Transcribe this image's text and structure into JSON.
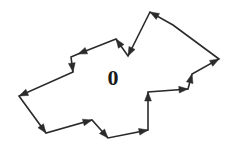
{
  "figure": {
    "name": "oriented-polygon-boundary",
    "canvas": {
      "width": 232,
      "height": 148,
      "background": "#ffffff"
    },
    "stroke": {
      "color": "#2b2b2b",
      "width": 1.6,
      "linejoin": "miter",
      "linecap": "butt"
    },
    "arrowhead": {
      "style": "solid-triangle",
      "length": 9,
      "half_width": 3.4,
      "color": "#2b2b2b"
    },
    "label": {
      "text": "0",
      "x": 113,
      "y": 78,
      "font_size": 22,
      "font_weight": "bold",
      "color": "#1a1a1a"
    },
    "orientation": "counterclockwise-chain",
    "vertex_count": 16,
    "closed": true,
    "vertices": [
      {
        "id": "v1",
        "x": 150,
        "y": 12,
        "arrow_in": true
      },
      {
        "id": "v2",
        "x": 128,
        "y": 56,
        "arrow_in": true
      },
      {
        "id": "v3",
        "x": 116,
        "y": 39,
        "arrow_in": true
      },
      {
        "id": "v4",
        "x": 78,
        "y": 54,
        "arrow_in": true
      },
      {
        "id": "v5",
        "x": 71,
        "y": 57,
        "arrow_in": false
      },
      {
        "id": "v6",
        "x": 73,
        "y": 72,
        "arrow_in": true
      },
      {
        "id": "v7",
        "x": 19,
        "y": 96,
        "arrow_in": true
      },
      {
        "id": "v8",
        "x": 46,
        "y": 133,
        "arrow_in": true
      },
      {
        "id": "v9",
        "x": 92,
        "y": 120,
        "arrow_in": true
      },
      {
        "id": "v10",
        "x": 108,
        "y": 138,
        "arrow_in": true
      },
      {
        "id": "v11",
        "x": 148,
        "y": 130,
        "arrow_in": true
      },
      {
        "id": "v12",
        "x": 148,
        "y": 92,
        "arrow_in": true
      },
      {
        "id": "v13",
        "x": 188,
        "y": 89,
        "arrow_in": true
      },
      {
        "id": "v14",
        "x": 192,
        "y": 74,
        "arrow_in": true
      },
      {
        "id": "v15",
        "x": 219,
        "y": 59,
        "arrow_in": true
      },
      {
        "id": "v16",
        "x": 173,
        "y": 25,
        "arrow_in": false
      }
    ]
  }
}
